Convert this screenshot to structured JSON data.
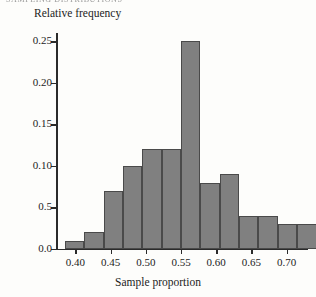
{
  "page": {
    "header_sliver": "SAMPLING DISTRIBUTIONS"
  },
  "chart_data": {
    "type": "bar",
    "title": "",
    "subtitle": "",
    "xlabel": "Sample proportion",
    "ylabel": "Relative frequency",
    "grid": false,
    "legend": "none",
    "xlim": [
      0.3725,
      0.7275
    ],
    "ylim": [
      0.0,
      0.26
    ],
    "bin_width": 0.0275,
    "bar_color": "#808080",
    "bar_edge_color": "#4a4a4a",
    "axis_color": "#2b2b2b",
    "xticks": [
      0.4,
      0.45,
      0.5,
      0.55,
      0.6,
      0.65,
      0.7
    ],
    "xtick_labels": [
      "0.40",
      "0.45",
      "0.50",
      "0.55",
      "0.60",
      "0.65",
      "0.70"
    ],
    "yticks": [
      0.0,
      0.05,
      0.1,
      0.15,
      0.2,
      0.25
    ],
    "ytick_labels": [
      "0.0",
      "0.5",
      "0.10",
      "0.15",
      "0.20",
      "0.25"
    ],
    "bins": [
      {
        "left": 0.385,
        "right": 0.4125,
        "value": 0.01
      },
      {
        "left": 0.4125,
        "right": 0.44,
        "value": 0.02
      },
      {
        "left": 0.44,
        "right": 0.4675,
        "value": 0.07
      },
      {
        "left": 0.4675,
        "right": 0.495,
        "value": 0.1
      },
      {
        "left": 0.495,
        "right": 0.5225,
        "value": 0.12
      },
      {
        "left": 0.5225,
        "right": 0.55,
        "value": 0.12
      },
      {
        "left": 0.55,
        "right": 0.5775,
        "value": 0.25
      },
      {
        "left": 0.5775,
        "right": 0.605,
        "value": 0.08
      },
      {
        "left": 0.605,
        "right": 0.6325,
        "value": 0.09
      },
      {
        "left": 0.6325,
        "right": 0.66,
        "value": 0.04
      },
      {
        "left": 0.66,
        "right": 0.6875,
        "value": 0.04
      },
      {
        "left": 0.6875,
        "right": 0.715,
        "value": 0.03
      },
      {
        "left": 0.715,
        "right": 0.7425,
        "value": 0.03
      }
    ],
    "categories": [
      "0.385-0.4125",
      "0.4125-0.44",
      "0.44-0.4675",
      "0.4675-0.495",
      "0.495-0.5225",
      "0.5225-0.55",
      "0.55-0.5775",
      "0.5775-0.605",
      "0.605-0.6325",
      "0.6325-0.66",
      "0.66-0.6875",
      "0.6875-0.715",
      "0.715-0.7425"
    ],
    "values": [
      0.01,
      0.02,
      0.07,
      0.1,
      0.12,
      0.12,
      0.25,
      0.08,
      0.09,
      0.04,
      0.04,
      0.03,
      0.03
    ]
  }
}
